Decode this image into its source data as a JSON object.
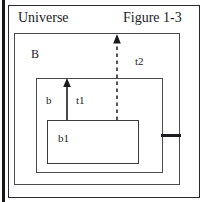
{
  "figure": {
    "title": "Figure 1-3",
    "universe_label": "Universe",
    "b_label": "B",
    "inner_b_label": "b",
    "b1_label": "b1",
    "t1_label": "t1",
    "t2_label": "t2"
  },
  "diagram_data": {
    "type": "nested-box-diagram",
    "description": "Nested rectangles labeled Universe, B, an unlabeled inner box, and b1, with two upward arrows t1 (solid) and t2 (dashed) rising from the b1 box.",
    "boxes": [
      {
        "name": "universe",
        "label": "Universe",
        "label_position": "top-left",
        "x": 8,
        "y": 5,
        "width": 192,
        "height": 193,
        "stroke": "#2a2a2e",
        "stroke_width": 1.6,
        "fill": "none"
      },
      {
        "name": "B",
        "label": "B",
        "label_position": "top-left",
        "x": 14,
        "y": 33,
        "width": 166,
        "height": 152,
        "stroke": "#4a4a50",
        "stroke_width": 1.4,
        "fill": "none"
      },
      {
        "name": "inner",
        "label": "",
        "label_position": "none",
        "x": 36,
        "y": 78,
        "width": 127,
        "height": 95,
        "stroke": "#4a4a50",
        "stroke_width": 1.4,
        "fill": "none"
      },
      {
        "name": "b1",
        "label": "b1",
        "label_position": "top-left-inside",
        "x": 47,
        "y": 120,
        "width": 92,
        "height": 44,
        "stroke": "#3a3a40",
        "stroke_width": 1.4,
        "fill": "none"
      }
    ],
    "arrows": [
      {
        "name": "t1",
        "label": "t1",
        "style": "solid",
        "direction": "up",
        "from": {
          "x": 67,
          "y": 120
        },
        "to": {
          "x": 67,
          "y": 80
        },
        "from_box": "b1",
        "to_box": "inner",
        "color": "#1b1b1f"
      },
      {
        "name": "t2",
        "label": "t2",
        "style": "dashed",
        "direction": "up",
        "from": {
          "x": 117,
          "y": 120
        },
        "to": {
          "x": 117,
          "y": 35
        },
        "from_box": "b1",
        "to_box": "B",
        "color": "#1b1b1f"
      }
    ],
    "connectors": [
      {
        "name": "inner-to-b-stub",
        "style": "thick-solid",
        "x1": 161,
        "y1": 135,
        "x2": 181,
        "y2": 135,
        "color": "#1d1d21"
      }
    ],
    "page_edge": {
      "name": "page-edge",
      "x": 2,
      "y": 0,
      "width": 3,
      "height": 202,
      "color": "#16161a"
    },
    "labels": [
      {
        "name": "universe",
        "text": "Universe",
        "x": 18,
        "y": 11,
        "font_size": 14
      },
      {
        "name": "figure-title",
        "text": "Figure 1-3",
        "x": 123,
        "y": 11,
        "font_size": 14
      },
      {
        "name": "B",
        "text": "B",
        "x": 31,
        "y": 48,
        "font_size": 12
      },
      {
        "name": "t2",
        "text": "t2",
        "x": 135,
        "y": 56,
        "font_size": 11
      },
      {
        "name": "b",
        "text": "b",
        "x": 46,
        "y": 95,
        "font_size": 11
      },
      {
        "name": "t1",
        "text": "t1",
        "x": 76,
        "y": 95,
        "font_size": 11
      },
      {
        "name": "b1",
        "text": "b1",
        "x": 58,
        "y": 133,
        "font_size": 11
      }
    ],
    "colors": {
      "background": "#ffffff",
      "stroke_dark": "#2a2a2e",
      "stroke_mid": "#4a4a50",
      "text": "#1b1b1f",
      "page_edge": "#16161a"
    }
  }
}
